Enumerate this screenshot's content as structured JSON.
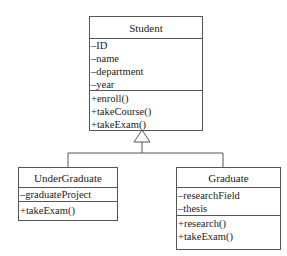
{
  "diagram": {
    "type": "uml-class-diagram",
    "classes": [
      {
        "name": "Student",
        "attributes": [
          "–ID",
          "–name",
          "–department",
          "–year"
        ],
        "methods": [
          "+enroll()",
          "+takeCourse()",
          "+takeExam()"
        ]
      },
      {
        "name": "UnderGraduate",
        "attributes": [
          "–graduateProject"
        ],
        "methods": [
          "+takeExam()"
        ]
      },
      {
        "name": "Graduate",
        "attributes": [
          "–researchField",
          "–thesis"
        ],
        "methods": [
          "+research()",
          "+takeExam()"
        ]
      }
    ],
    "relationships": [
      {
        "type": "generalization",
        "from": "UnderGraduate",
        "to": "Student"
      },
      {
        "type": "generalization",
        "from": "Graduate",
        "to": "Student"
      }
    ],
    "colors": {
      "line": "#555555",
      "text": "#222222",
      "background": "#ffffff"
    }
  }
}
